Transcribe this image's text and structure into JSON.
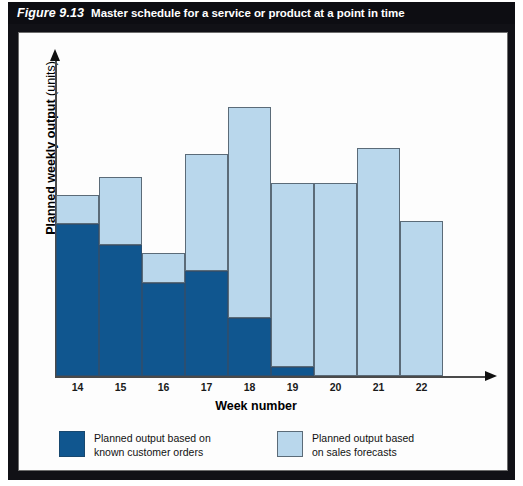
{
  "figure": {
    "number": "Figure 9.13",
    "title": "Master schedule for a service or product at a point in time"
  },
  "chart_data": {
    "type": "bar",
    "stacked": true,
    "title": "Master schedule for a service or product at a point in time",
    "xlabel": "Week number",
    "ylabel": "Planned weekly output (units)",
    "ylabel_bold_part": "Planned weekly output",
    "ylabel_regular_part": "(units)",
    "grid": false,
    "ylim": [
      0,
      100
    ],
    "yticks_shown": false,
    "legend_position": "bottom",
    "categories": [
      "14",
      "15",
      "16",
      "17",
      "18",
      "19",
      "20",
      "21",
      "22"
    ],
    "series": [
      {
        "name": "Planned output based on known customer orders",
        "color": "#10568f",
        "values": [
          52,
          45,
          32,
          36,
          20,
          3,
          0,
          0,
          0
        ]
      },
      {
        "name": "Planned output based on sales forecasts",
        "color": "#b9d7ec",
        "values": [
          10,
          23,
          10,
          40,
          72,
          63,
          66,
          78,
          53
        ]
      }
    ],
    "totals": [
      62,
      68,
      42,
      76,
      92,
      66,
      66,
      78,
      53
    ]
  },
  "axes": {
    "x_title": "Week number",
    "y_title_bold": "Planned weekly output",
    "y_title_regular": "(units)",
    "x_ticks": [
      "14",
      "15",
      "16",
      "17",
      "18",
      "19",
      "20",
      "21",
      "22"
    ]
  },
  "legend": {
    "items": [
      {
        "key": "known-customer-orders",
        "label": "Planned output based on\nknown customer orders",
        "color": "#10568f"
      },
      {
        "key": "sales-forecasts",
        "label": "Planned output based\non sales forecasts",
        "color": "#b9d7ec"
      }
    ]
  },
  "colors": {
    "orders": "#10568f",
    "forecasts": "#b9d7ec",
    "title_bar_bg": "#0d0d12",
    "frame": "#111116"
  }
}
